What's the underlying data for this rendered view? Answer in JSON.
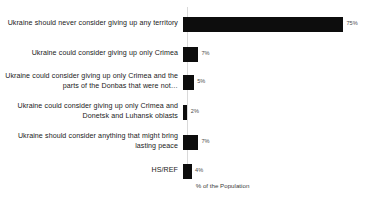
{
  "chart_data": {
    "type": "bar",
    "orientation": "horizontal",
    "title": "",
    "xlabel": "% of the Population",
    "ylabel": "",
    "xlim": [
      0,
      80
    ],
    "grid": false,
    "legend": null,
    "bar_color": "#0d0d0d",
    "axis_color": "#d9d9d9",
    "value_suffix": "%",
    "categories": [
      "Ukraine should never consider giving up any territory",
      "Ukraine could consider giving up only Crimea",
      "Ukraine could consider giving up only Crimea and the parts of the Donbas that were not…",
      "Ukraine could consider giving up only Crimea and Donetsk and Luhansk oblasts",
      "Ukraine should consider anything that might bring lasting peace",
      "HS/REF"
    ],
    "values": [
      75,
      7,
      5,
      2,
      7,
      4
    ],
    "value_labels": [
      "75%",
      "7%",
      "5%",
      "2%",
      "7%",
      "4%"
    ],
    "rows": [
      {
        "label": "Ukraine should never consider giving up any territory",
        "value": 75,
        "value_label": "75%",
        "row_height": 34
      },
      {
        "label": "Ukraine could consider giving up only Crimea",
        "value": 7,
        "value_label": "7%",
        "row_height": 26
      },
      {
        "label": "Ukraine could consider giving up only Crimea and the parts of the Donbas that were not…",
        "value": 5,
        "value_label": "5%",
        "row_height": 30
      },
      {
        "label": "Ukraine could consider giving up only Crimea and Donetsk and Luhansk oblasts",
        "value": 2,
        "value_label": "2%",
        "row_height": 30
      },
      {
        "label": "Ukraine should consider anything that might bring lasting peace",
        "value": 7,
        "value_label": "7%",
        "row_height": 30
      },
      {
        "label": "HS/REF",
        "value": 4,
        "value_label": "4%",
        "row_height": 28
      }
    ]
  }
}
